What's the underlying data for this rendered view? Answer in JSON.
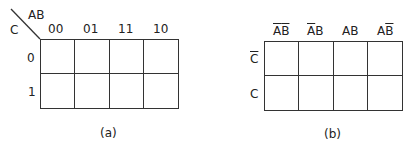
{
  "map_a": {
    "corner_row_var": "C",
    "corner_col_var": "AB",
    "col_labels": [
      "00",
      "01",
      "11",
      "10"
    ],
    "row_labels": [
      "0",
      "1"
    ],
    "caption": "(a)"
  },
  "map_b": {
    "col_labels": [
      {
        "parts": [
          {
            "t": "A",
            "bar": true
          },
          {
            "t": "B",
            "bar": true
          }
        ]
      },
      {
        "parts": [
          {
            "t": "A",
            "bar": true
          },
          {
            "t": "B",
            "bar": false
          }
        ]
      },
      {
        "parts": [
          {
            "t": "A",
            "bar": false
          },
          {
            "t": "B",
            "bar": false
          }
        ]
      },
      {
        "parts": [
          {
            "t": "A",
            "bar": false
          },
          {
            "t": "B",
            "bar": true
          }
        ]
      }
    ],
    "row_labels": [
      {
        "t": "C",
        "bar": true
      },
      {
        "t": "C",
        "bar": false
      }
    ],
    "caption": "(b)"
  }
}
